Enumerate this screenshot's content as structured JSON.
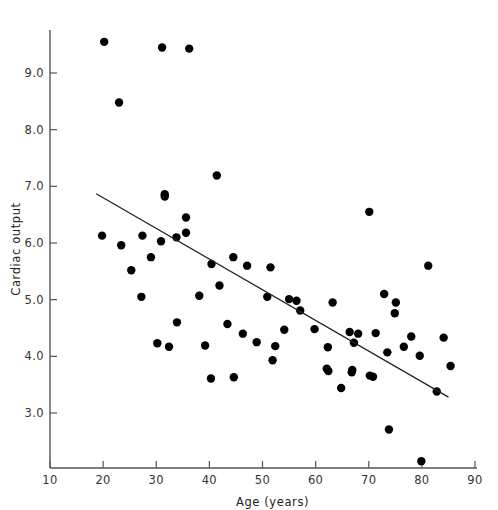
{
  "chart_data": {
    "type": "scatter",
    "title": "",
    "xlabel": "Age (years)",
    "ylabel": "Cardiac output",
    "xlim": [
      10,
      90
    ],
    "ylim": [
      2.0,
      9.8
    ],
    "xticks": [
      10,
      20,
      30,
      40,
      50,
      60,
      70,
      80,
      90
    ],
    "xtick_labels": [
      "10",
      "20",
      "30",
      "40",
      "50",
      "60",
      "70",
      "80",
      "90"
    ],
    "yticks": [
      3.0,
      4.0,
      5.0,
      6.0,
      7.0,
      8.0,
      9.0
    ],
    "ytick_labels": [
      "3.0",
      "4.0",
      "5.0",
      "6.0",
      "7.0",
      "8.0",
      "9.0"
    ],
    "grid": false,
    "legend": "none",
    "marker_color": "#000000",
    "marker_size": 4.2,
    "line_color": "#222222",
    "axis_color": "#555555",
    "background": "#ffffff",
    "points": [
      {
        "x": 20.2,
        "y": 9.55
      },
      {
        "x": 31.1,
        "y": 9.45
      },
      {
        "x": 36.2,
        "y": 9.43
      },
      {
        "x": 23.0,
        "y": 8.48
      },
      {
        "x": 41.4,
        "y": 7.19
      },
      {
        "x": 31.6,
        "y": 6.86
      },
      {
        "x": 31.6,
        "y": 6.82
      },
      {
        "x": 70.1,
        "y": 6.55
      },
      {
        "x": 35.6,
        "y": 6.45
      },
      {
        "x": 35.6,
        "y": 6.18
      },
      {
        "x": 19.8,
        "y": 6.13
      },
      {
        "x": 27.4,
        "y": 6.13
      },
      {
        "x": 33.8,
        "y": 6.1
      },
      {
        "x": 30.9,
        "y": 6.03
      },
      {
        "x": 23.4,
        "y": 5.96
      },
      {
        "x": 25.3,
        "y": 5.52
      },
      {
        "x": 29.0,
        "y": 5.75
      },
      {
        "x": 40.4,
        "y": 5.63
      },
      {
        "x": 44.5,
        "y": 5.75
      },
      {
        "x": 47.1,
        "y": 5.6
      },
      {
        "x": 51.5,
        "y": 5.57
      },
      {
        "x": 81.2,
        "y": 5.6
      },
      {
        "x": 27.2,
        "y": 5.05
      },
      {
        "x": 38.1,
        "y": 5.07
      },
      {
        "x": 41.9,
        "y": 5.25
      },
      {
        "x": 50.9,
        "y": 5.05
      },
      {
        "x": 55.0,
        "y": 5.01
      },
      {
        "x": 56.4,
        "y": 4.98
      },
      {
        "x": 57.1,
        "y": 4.81
      },
      {
        "x": 63.2,
        "y": 4.95
      },
      {
        "x": 72.9,
        "y": 5.1
      },
      {
        "x": 75.1,
        "y": 4.95
      },
      {
        "x": 74.9,
        "y": 4.76
      },
      {
        "x": 33.9,
        "y": 4.6
      },
      {
        "x": 43.4,
        "y": 4.57
      },
      {
        "x": 46.3,
        "y": 4.4
      },
      {
        "x": 54.1,
        "y": 4.47
      },
      {
        "x": 59.8,
        "y": 4.48
      },
      {
        "x": 66.4,
        "y": 4.43
      },
      {
        "x": 68.0,
        "y": 4.4
      },
      {
        "x": 67.2,
        "y": 4.24
      },
      {
        "x": 71.3,
        "y": 4.41
      },
      {
        "x": 78.0,
        "y": 4.35
      },
      {
        "x": 84.1,
        "y": 4.33
      },
      {
        "x": 30.2,
        "y": 4.23
      },
      {
        "x": 32.4,
        "y": 4.17
      },
      {
        "x": 39.2,
        "y": 4.19
      },
      {
        "x": 48.9,
        "y": 4.25
      },
      {
        "x": 52.4,
        "y": 4.18
      },
      {
        "x": 62.3,
        "y": 4.16
      },
      {
        "x": 73.5,
        "y": 4.07
      },
      {
        "x": 76.6,
        "y": 4.17
      },
      {
        "x": 79.6,
        "y": 4.01
      },
      {
        "x": 40.3,
        "y": 3.61
      },
      {
        "x": 44.6,
        "y": 3.63
      },
      {
        "x": 51.9,
        "y": 3.93
      },
      {
        "x": 62.1,
        "y": 3.78
      },
      {
        "x": 62.4,
        "y": 3.74
      },
      {
        "x": 66.9,
        "y": 3.76
      },
      {
        "x": 66.8,
        "y": 3.72
      },
      {
        "x": 70.2,
        "y": 3.66
      },
      {
        "x": 70.8,
        "y": 3.64
      },
      {
        "x": 64.8,
        "y": 3.44
      },
      {
        "x": 82.8,
        "y": 3.38
      },
      {
        "x": 85.4,
        "y": 3.83
      },
      {
        "x": 73.8,
        "y": 2.71
      },
      {
        "x": 79.9,
        "y": 2.15
      }
    ],
    "fit_line": {
      "x0": 18.7,
      "y0": 6.87,
      "x1": 85.0,
      "y1": 3.28,
      "label": "regression line"
    }
  }
}
